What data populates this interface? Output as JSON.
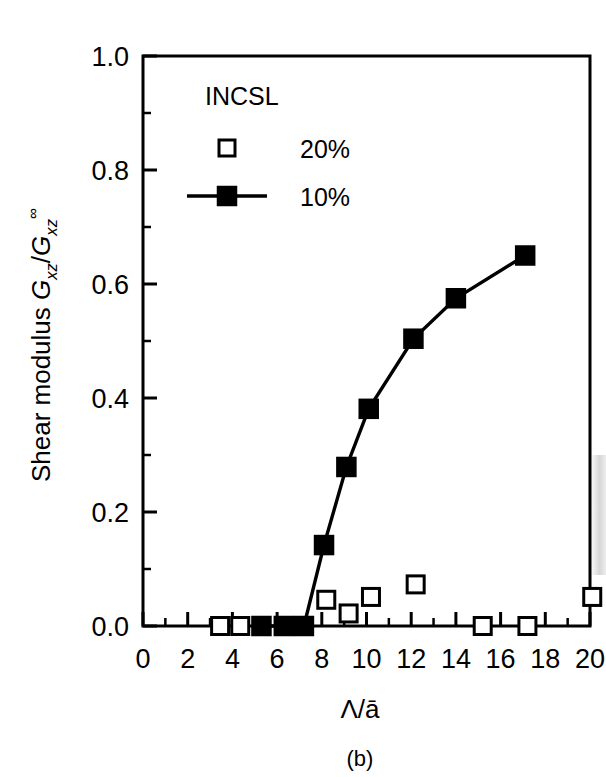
{
  "figure": {
    "caption": "(b)",
    "background_color": "#ffffff",
    "ink_color": "#000000"
  },
  "chart_data": {
    "type": "scatter",
    "title": "",
    "xlabel": "Λ/ā",
    "ylabel": "Shear modulus G",
    "ylabel_parts": {
      "prefix": "Shear modulus ",
      "g1": "G",
      "g1_sub": "xz",
      "slash": "/",
      "g2": "G",
      "g2_sub": "xz",
      "g2_sup": "∞"
    },
    "xlim": [
      0,
      20
    ],
    "ylim": [
      0.0,
      1.0
    ],
    "xticks": [
      0,
      2,
      4,
      6,
      8,
      10,
      12,
      14,
      16,
      18,
      20
    ],
    "xticklabels": [
      "0",
      "2",
      "4",
      "6",
      "8",
      "10",
      "12",
      "14",
      "16",
      "18",
      "20"
    ],
    "xminorticks": [
      1,
      3,
      5,
      7,
      9,
      11,
      13,
      15,
      17,
      19
    ],
    "yticks": [
      0.0,
      0.2,
      0.4,
      0.6,
      0.8,
      1.0
    ],
    "yticklabels": [
      "0.0",
      "0.2",
      "0.4",
      "0.6",
      "0.8",
      "1.0"
    ],
    "yminorticks": [
      0.1,
      0.3,
      0.5,
      0.7,
      0.9
    ],
    "grid": false,
    "legend": {
      "title": "INCSL",
      "position": "upper-left-inside",
      "entries": [
        {
          "label": "20%",
          "marker": "open-square",
          "line": false
        },
        {
          "label": "10%",
          "marker": "filled-square",
          "line": true
        }
      ]
    },
    "series": [
      {
        "name": "10%",
        "marker": "filled-square",
        "line": true,
        "points": [
          {
            "x": 5.3,
            "y": 0.0
          },
          {
            "x": 6.3,
            "y": 0.0
          },
          {
            "x": 7.2,
            "y": 0.0
          },
          {
            "x": 8.1,
            "y": 0.142
          },
          {
            "x": 9.1,
            "y": 0.279
          },
          {
            "x": 10.1,
            "y": 0.381
          },
          {
            "x": 12.1,
            "y": 0.504
          },
          {
            "x": 14.0,
            "y": 0.575
          },
          {
            "x": 17.1,
            "y": 0.65
          }
        ]
      },
      {
        "name": "20%",
        "marker": "open-square",
        "line": false,
        "points": [
          {
            "x": 3.45,
            "y": 0.0
          },
          {
            "x": 4.35,
            "y": 0.0
          },
          {
            "x": 8.2,
            "y": 0.046
          },
          {
            "x": 9.2,
            "y": 0.022
          },
          {
            "x": 10.2,
            "y": 0.051
          },
          {
            "x": 12.2,
            "y": 0.073
          },
          {
            "x": 15.2,
            "y": 0.0
          },
          {
            "x": 17.2,
            "y": 0.0
          },
          {
            "x": 20.1,
            "y": 0.051
          }
        ]
      }
    ]
  }
}
